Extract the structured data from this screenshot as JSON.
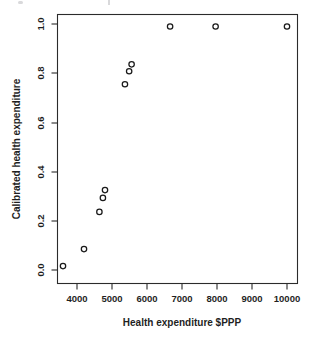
{
  "chart_data": {
    "type": "scatter",
    "title": "",
    "xlabel": "Health expenditure $PPP",
    "ylabel": "Calibrated health expenditure",
    "xlim": [
      3400,
      10200
    ],
    "ylim": [
      -0.02,
      1.02
    ],
    "xticks": [
      4000,
      5000,
      6000,
      7000,
      8000,
      9000,
      10000
    ],
    "xtick_labels": [
      "4000",
      "5000",
      "6000",
      "7000",
      "8000",
      "9000",
      "10000"
    ],
    "yticks": [
      0.0,
      0.2,
      0.4,
      0.6,
      0.8,
      1.0
    ],
    "ytick_labels": [
      "0.0",
      "0.2",
      "0.4",
      "0.6",
      "0.8",
      "1.0"
    ],
    "grid": false,
    "legend": false,
    "marker": "open-circle",
    "marker_color": "#1a1a1a",
    "points": [
      {
        "x": 3600,
        "y": 0.016
      },
      {
        "x": 4200,
        "y": 0.085
      },
      {
        "x": 4640,
        "y": 0.236
      },
      {
        "x": 4740,
        "y": 0.293
      },
      {
        "x": 4800,
        "y": 0.325
      },
      {
        "x": 5370,
        "y": 0.755
      },
      {
        "x": 5490,
        "y": 0.808
      },
      {
        "x": 5560,
        "y": 0.836
      },
      {
        "x": 6660,
        "y": 0.99
      },
      {
        "x": 7960,
        "y": 0.99
      },
      {
        "x": 10000,
        "y": 0.99
      }
    ]
  },
  "axes": {
    "x_title": "Health expenditure $PPP",
    "y_title": "Calibrated health expenditure"
  }
}
